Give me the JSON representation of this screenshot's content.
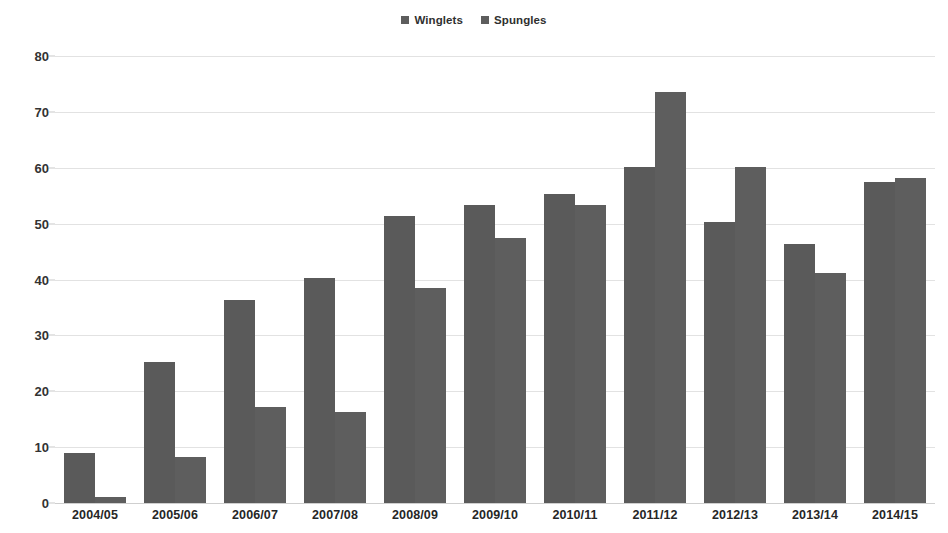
{
  "chart_data": {
    "type": "bar",
    "title": "",
    "xlabel": "",
    "ylabel": "",
    "ylim": [
      0,
      80
    ],
    "ytick_step": 10,
    "yticks": [
      80,
      70,
      60,
      50,
      40,
      30,
      20,
      10,
      0
    ],
    "grid": true,
    "legend_position": "top-center",
    "categories": [
      "2004/05",
      "2005/06",
      "2006/07",
      "2007/08",
      "2008/09",
      "2009/10",
      "2010/11",
      "2011/12",
      "2012/13",
      "2013/14",
      "2014/15"
    ],
    "series": [
      {
        "name": "Winglets",
        "color": "#5a5a5a",
        "values": [
          9.0,
          25.2,
          36.3,
          40.3,
          51.3,
          53.3,
          55.3,
          60.2,
          50.3,
          46.3,
          57.4
        ]
      },
      {
        "name": "Spungles",
        "color": "#5e5e5e",
        "values": [
          1.1,
          8.2,
          17.2,
          16.3,
          38.4,
          47.4,
          53.3,
          73.6,
          60.2,
          41.2,
          58.1
        ]
      }
    ]
  },
  "legend": {
    "items": [
      {
        "label": "Winglets",
        "color": "#5d5d5d"
      },
      {
        "label": "Spungles",
        "color": "#5d5d5d"
      }
    ]
  },
  "axis": {
    "y_labels": [
      "80",
      "70",
      "60",
      "50",
      "40",
      "30",
      "20",
      "10",
      "0"
    ]
  },
  "colors": {
    "bar": "#5a5a5a",
    "gridline": "#e2e2e2",
    "text": "#262626",
    "background": "#ffffff"
  }
}
